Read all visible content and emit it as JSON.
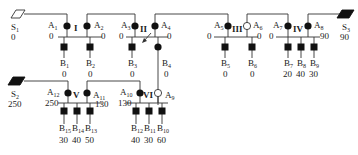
{
  "legend_symbols": {
    "source_empty": "outlined parallelogram",
    "source_filled": "filled parallelogram",
    "node_filled": "filled circle",
    "node_open": "open circle",
    "sink": "filled square"
  },
  "sources": [
    {
      "id": "S1",
      "label": "S",
      "sub": "1",
      "value": "0",
      "filled": false
    },
    {
      "id": "S2",
      "label": "S",
      "sub": "2",
      "value": "250",
      "filled": true
    },
    {
      "id": "S3",
      "label": "S",
      "sub": "3",
      "value": "90",
      "filled": true
    }
  ],
  "stations": [
    {
      "id": "I",
      "label": "I"
    },
    {
      "id": "II",
      "label": "II"
    },
    {
      "id": "III",
      "label": "III"
    },
    {
      "id": "IV",
      "label": "IV"
    },
    {
      "id": "V",
      "label": "V"
    },
    {
      "id": "VI",
      "label": "VI"
    }
  ],
  "nodes": [
    {
      "id": "A1",
      "label": "A",
      "sub": "1",
      "value": "0",
      "filled": true
    },
    {
      "id": "A2",
      "label": "A",
      "sub": "2",
      "value": "0",
      "filled": true
    },
    {
      "id": "A3",
      "label": "A",
      "sub": "3",
      "value": "0",
      "filled": true
    },
    {
      "id": "A4",
      "label": "A",
      "sub": "4",
      "value": "0",
      "filled": true
    },
    {
      "id": "A5",
      "label": "A",
      "sub": "5",
      "value": "0",
      "filled": true
    },
    {
      "id": "A6",
      "label": "A",
      "sub": "6",
      "value": "0",
      "filled": false
    },
    {
      "id": "A7",
      "label": "A",
      "sub": "7",
      "value": "0",
      "filled": true
    },
    {
      "id": "A8",
      "label": "A",
      "sub": "8",
      "value": "90",
      "filled": true
    },
    {
      "id": "A9",
      "label": "A",
      "sub": "9",
      "value": "",
      "filled": false
    },
    {
      "id": "A10",
      "label": "A",
      "sub": "10",
      "value": "130",
      "filled": true
    },
    {
      "id": "A11",
      "label": "A",
      "sub": "11",
      "value": "130",
      "filled": true
    },
    {
      "id": "A12",
      "label": "A",
      "sub": "12",
      "value": "250",
      "filled": true
    }
  ],
  "sinks": [
    {
      "id": "B1",
      "label": "B",
      "sub": "1",
      "value": "0"
    },
    {
      "id": "B2",
      "label": "B",
      "sub": "2",
      "value": "0"
    },
    {
      "id": "B3",
      "label": "B",
      "sub": "3",
      "value": "0"
    },
    {
      "id": "B4",
      "label": "B",
      "sub": "4",
      "value": "0"
    },
    {
      "id": "B5",
      "label": "B",
      "sub": "5",
      "value": "0"
    },
    {
      "id": "B6",
      "label": "B",
      "sub": "6",
      "value": "0"
    },
    {
      "id": "B7",
      "label": "B",
      "sub": "7",
      "value": "20"
    },
    {
      "id": "B8",
      "label": "B",
      "sub": "8",
      "value": "40"
    },
    {
      "id": "B9",
      "label": "B",
      "sub": "9",
      "value": "30"
    },
    {
      "id": "B10",
      "label": "B",
      "sub": "10",
      "value": "60"
    },
    {
      "id": "B11",
      "label": "B",
      "sub": "11",
      "value": "30"
    },
    {
      "id": "B12",
      "label": "B",
      "sub": "12",
      "value": "40"
    },
    {
      "id": "B13",
      "label": "B",
      "sub": "13",
      "value": "50"
    },
    {
      "id": "B14",
      "label": "B",
      "sub": "14",
      "value": "40"
    },
    {
      "id": "B15",
      "label": "B",
      "sub": "15",
      "value": "30"
    }
  ]
}
